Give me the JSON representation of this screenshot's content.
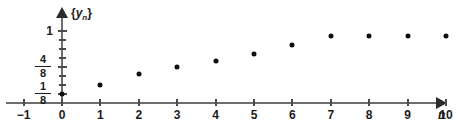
{
  "chart_data": {
    "type": "scatter",
    "title": "",
    "xlabel": "n",
    "ylabel": "{y_n}",
    "ylabel_parts": {
      "open": "{",
      "var": "y",
      "sub": "n",
      "close": "}"
    },
    "xlim": [
      -1,
      10
    ],
    "ylim": [
      0,
      1.125
    ],
    "grid": false,
    "legend": null,
    "x_ticks": [
      -1,
      0,
      1,
      2,
      3,
      4,
      5,
      6,
      7,
      8,
      9,
      10
    ],
    "x_tick_labels": [
      "−1",
      "0",
      "1",
      "2",
      "3",
      "4",
      "5",
      "6",
      "7",
      "8",
      "9",
      "10"
    ],
    "y_ticks": [
      0.125,
      0.25,
      0.375,
      0.5,
      0.625,
      0.75,
      0.875,
      1.0
    ],
    "y_tick_labels": [
      "1/8",
      "",
      "",
      "4/8",
      "",
      "",
      "",
      "1"
    ],
    "y_labeled_ticks": [
      {
        "value": 1.0,
        "kind": "integer",
        "text": "1"
      },
      {
        "value": 0.5,
        "kind": "fraction",
        "numerator": "4",
        "denominator": "8"
      },
      {
        "value": 0.125,
        "kind": "fraction",
        "numerator": "1",
        "denominator": "8"
      }
    ],
    "x": [
      0,
      1,
      2,
      3,
      4,
      5,
      6,
      7,
      8,
      9,
      10
    ],
    "values": [
      0.125,
      0.25,
      0.4,
      0.5,
      0.58,
      0.68,
      0.8,
      0.93,
      0.93,
      0.93,
      0.93
    ],
    "points": [
      {
        "n": 0,
        "y": 0.125
      },
      {
        "n": 1,
        "y": 0.25
      },
      {
        "n": 2,
        "y": 0.4
      },
      {
        "n": 3,
        "y": 0.5
      },
      {
        "n": 4,
        "y": 0.58
      },
      {
        "n": 5,
        "y": 0.68
      },
      {
        "n": 6,
        "y": 0.8
      },
      {
        "n": 7,
        "y": 0.93
      },
      {
        "n": 8,
        "y": 0.93
      },
      {
        "n": 9,
        "y": 0.93
      },
      {
        "n": 10,
        "y": 0.93
      }
    ],
    "marker": "dot",
    "marker_color": "#111111",
    "axis_color": "#6d6d6d",
    "text_color": "#1b1b1b"
  }
}
